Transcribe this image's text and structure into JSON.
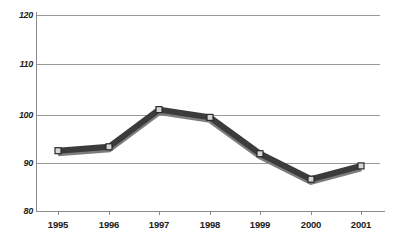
{
  "chart_data": {
    "type": "line",
    "title": "",
    "subtitle": "",
    "xlabel": "",
    "ylabel": "",
    "categories": [
      "1995",
      "1996",
      "1997",
      "1998",
      "1999",
      "2000",
      "2001"
    ],
    "values": [
      92.3,
      93.1,
      100.7,
      99.1,
      91.7,
      86.5,
      89.2
    ],
    "series": [
      {
        "name": "",
        "values": [
          92.3,
          93.1,
          100.7,
          99.1,
          91.7,
          86.5,
          89.2
        ]
      }
    ],
    "ylim": [
      80,
      120
    ],
    "yticks": [
      80,
      90,
      100,
      110,
      120
    ],
    "ytick_labels": [
      "80",
      "90",
      "100",
      "110",
      "120"
    ],
    "xtick_labels": [
      "1995",
      "1996",
      "1997",
      "1998",
      "1999",
      "2000",
      "2001"
    ],
    "grid": "horizontal",
    "legend": "none",
    "annotations": [],
    "colors": {
      "line": "#3a3a3a",
      "line_highlight": "#6e6e6e",
      "marker_fill": "#d9d9d9",
      "marker_edge": "#2a2a2a",
      "gridline": "#9a9a9a",
      "axis": "#8a8a8a",
      "text": "#1c1c1c",
      "background": "#ffffff"
    }
  }
}
